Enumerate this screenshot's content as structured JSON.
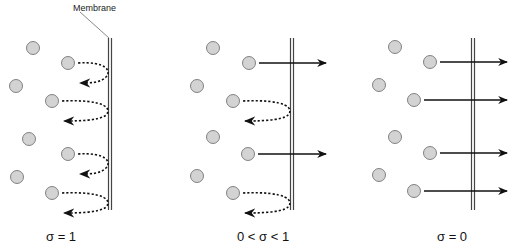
{
  "membrane_label": "Membrane",
  "colors": {
    "particle_fill": "#d3d3d3",
    "particle_stroke": "#666666",
    "membrane": "#444444",
    "arrow": "#111111"
  },
  "panels": [
    {
      "caption": "σ = 1",
      "membrane_x": 110,
      "particles": [
        [
          33,
          48
        ],
        [
          68,
          63
        ],
        [
          16,
          86
        ],
        [
          52,
          101
        ],
        [
          29,
          139
        ],
        [
          68,
          154
        ],
        [
          17,
          177
        ],
        [
          52,
          193
        ]
      ],
      "reflected": [
        [
          68,
          63
        ],
        [
          52,
          101
        ],
        [
          68,
          154
        ],
        [
          52,
          193
        ]
      ],
      "transmitted": []
    },
    {
      "caption": "0 < σ < 1",
      "membrane_x": 292,
      "particles": [
        [
          213,
          48
        ],
        [
          249,
          63
        ],
        [
          197,
          86
        ],
        [
          233,
          101
        ],
        [
          213,
          137
        ],
        [
          248,
          154
        ],
        [
          197,
          176
        ],
        [
          233,
          193
        ]
      ],
      "reflected": [
        [
          233,
          101
        ],
        [
          233,
          193
        ]
      ],
      "transmitted": [
        [
          249,
          63
        ],
        [
          248,
          154
        ]
      ]
    },
    {
      "caption": "σ = 0",
      "membrane_x": 473,
      "particles": [
        [
          395,
          47
        ],
        [
          430,
          62
        ],
        [
          379,
          85
        ],
        [
          414,
          100
        ],
        [
          395,
          137
        ],
        [
          430,
          153
        ],
        [
          379,
          175
        ],
        [
          414,
          191
        ]
      ],
      "reflected": [],
      "transmitted": [
        [
          430,
          62
        ],
        [
          414,
          100
        ],
        [
          430,
          153
        ],
        [
          414,
          191
        ]
      ]
    }
  ]
}
